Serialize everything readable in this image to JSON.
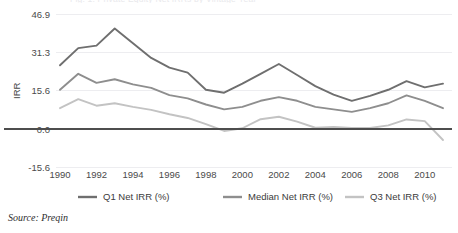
{
  "figure": {
    "source_note": "Source: Preqin",
    "partial_title_top": "Fig. 1: Private Equity Net IRRs by Vintage Year"
  },
  "colors": {
    "q1": "#6f6f6f",
    "median": "#8e8e8e",
    "q3": "#c3c3c3",
    "gridline": "#ededf0",
    "zeroline": "#4d4d4d",
    "text": "#3b3b3b"
  },
  "chart_data": {
    "type": "line",
    "title": "",
    "xlabel": "",
    "ylabel": "IRR",
    "ylim": [
      -15.6,
      46.9
    ],
    "yticks": [
      -15.6,
      0.0,
      15.6,
      31.3,
      46.9
    ],
    "ytick_labels": [
      "-15.6",
      "0.0",
      "15.6",
      "31.3",
      "46.9"
    ],
    "xlim": [
      1990,
      2011
    ],
    "xticks": [
      1990,
      1992,
      1994,
      1996,
      1998,
      2000,
      2002,
      2004,
      2006,
      2008,
      2010
    ],
    "xtick_labels": [
      "1990",
      "1992",
      "1994",
      "1996",
      "1998",
      "2000",
      "2002",
      "2004",
      "2006",
      "2008",
      "2010"
    ],
    "grid": true,
    "legend_position": "bottom",
    "x": [
      1990,
      1991,
      1992,
      1993,
      1994,
      1995,
      1996,
      1997,
      1998,
      1999,
      2000,
      2001,
      2002,
      2003,
      2004,
      2005,
      2006,
      2007,
      2008,
      2009,
      2010,
      2011
    ],
    "series": [
      {
        "name": "Q1 Net IRR (%)",
        "color": "#6f6f6f",
        "values": [
          26.0,
          33.0,
          34.0,
          41.0,
          35.0,
          29.0,
          25.0,
          23.0,
          16.0,
          14.8,
          18.5,
          22.5,
          26.5,
          22.0,
          17.5,
          14.0,
          11.5,
          13.5,
          16.0,
          19.5,
          17.0,
          18.5
        ]
      },
      {
        "name": "Median Net IRR (%)",
        "color": "#8e8e8e",
        "values": [
          16.0,
          22.5,
          18.8,
          20.3,
          18.2,
          16.8,
          13.8,
          12.5,
          10.0,
          8.0,
          9.0,
          11.5,
          13.0,
          11.5,
          9.0,
          8.0,
          7.0,
          8.5,
          10.5,
          13.7,
          11.5,
          8.5
        ]
      },
      {
        "name": "Q3 Net IRR (%)",
        "color": "#c3c3c3",
        "values": [
          8.5,
          12.2,
          9.5,
          10.5,
          9.0,
          7.8,
          6.0,
          4.5,
          2.0,
          -0.8,
          0.3,
          4.0,
          5.0,
          3.0,
          0.5,
          0.8,
          0.4,
          0.4,
          1.5,
          3.9,
          3.2,
          -4.5
        ]
      }
    ]
  },
  "legend": {
    "items": [
      {
        "label": "Q1 Net IRR (%)"
      },
      {
        "label": "Median Net IRR (%)"
      },
      {
        "label": "Q3 Net IRR (%)"
      }
    ]
  }
}
